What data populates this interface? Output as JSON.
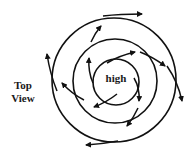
{
  "diagram": {
    "title_line1": "Top",
    "title_line2": "View",
    "center_label": "high",
    "colors": {
      "stroke": "#111111",
      "background": "#ffffff"
    },
    "center": [
      115,
      80
    ],
    "isobars": [
      {
        "name": "inner",
        "rx": 23,
        "ry": 23
      },
      {
        "name": "middle",
        "rx": 42,
        "ry": 41
      },
      {
        "name": "outer",
        "rx": 62,
        "ry": 62
      }
    ],
    "arrow_count": 12
  }
}
